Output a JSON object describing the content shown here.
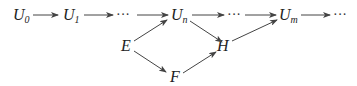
{
  "diagram": {
    "type": "commutative-diagram",
    "nodes": [
      {
        "id": "U0",
        "base": "U",
        "sub": "0",
        "x": 13,
        "y": 20
      },
      {
        "id": "U1",
        "base": "U",
        "sub": "1",
        "x": 63,
        "y": 20
      },
      {
        "id": "dots1",
        "text": "···",
        "x": 117,
        "y": 18
      },
      {
        "id": "Un",
        "base": "U",
        "sub": "n",
        "x": 171,
        "y": 20
      },
      {
        "id": "dots2",
        "text": "···",
        "x": 228,
        "y": 18
      },
      {
        "id": "Um",
        "base": "U",
        "sub": "m",
        "x": 279,
        "y": 20
      },
      {
        "id": "dots3",
        "text": "···",
        "x": 333,
        "y": 18
      },
      {
        "id": "E",
        "base": "E",
        "x": 122,
        "y": 51
      },
      {
        "id": "H",
        "base": "H",
        "x": 217,
        "y": 51
      },
      {
        "id": "F",
        "base": "F",
        "x": 170,
        "y": 82
      }
    ],
    "edges": [
      {
        "from": "U0",
        "to": "U1"
      },
      {
        "from": "U1",
        "to": "dots1"
      },
      {
        "from": "dots1",
        "to": "Un"
      },
      {
        "from": "Un",
        "to": "dots2"
      },
      {
        "from": "dots2",
        "to": "Um"
      },
      {
        "from": "Um",
        "to": "dots3"
      },
      {
        "from": "E",
        "to": "Un"
      },
      {
        "from": "E",
        "to": "F"
      },
      {
        "from": "Un",
        "to": "H"
      },
      {
        "from": "F",
        "to": "H"
      },
      {
        "from": "H",
        "to": "Um"
      }
    ],
    "labels": {
      "U0_base": "U",
      "U0_sub": "0",
      "U1_base": "U",
      "U1_sub": "1",
      "Un_base": "U",
      "Un_sub": "n",
      "Um_base": "U",
      "Um_sub": "m",
      "E": "E",
      "F": "F",
      "H": "H",
      "dots": "···"
    }
  }
}
